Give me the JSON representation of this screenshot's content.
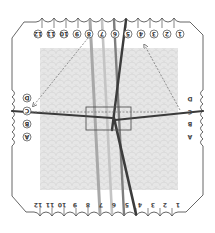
{
  "diagram": {
    "colors": {
      "outline": "#555555",
      "pattern_bg": "#e4e4e4",
      "pattern_stroke": "#d6d6d6",
      "thread_light": "#b9b9b9",
      "thread_mid": "#8c8c8c",
      "thread_dark": "#4a4a4a",
      "thread_darkest": "#333333",
      "arrow": "#777777",
      "center_box": "#555555"
    },
    "top_labels": [
      "12",
      "11",
      "10",
      "9",
      "8",
      "7",
      "6",
      "5",
      "4",
      "3",
      "2",
      "1"
    ],
    "bottom_labels": [
      "12",
      "11",
      "10",
      "9",
      "8",
      "7",
      "6",
      "5",
      "4",
      "3",
      "2",
      "1"
    ],
    "left_labels": [
      "D",
      "C",
      "B",
      "A"
    ],
    "right_labels": [
      "D",
      "C",
      "B",
      "A"
    ],
    "label_orientation": {
      "top": "rotated 180° circled",
      "bottom": "rotated 180° plain",
      "left": "rotated 180° circled",
      "right": "rotated 180° plain"
    },
    "arrows": [
      {
        "name": "arrow-slot-8-to-D-left",
        "from": "top slot 8",
        "to": "left slot D",
        "style": "dashed"
      },
      {
        "name": "arrow-right-to-slot-4",
        "from": "right slot C area",
        "to": "top slot 4",
        "style": "dashed"
      },
      {
        "name": "arrow-horizontal-C",
        "from": "left slot C",
        "to": "right slot C",
        "style": "dashed"
      }
    ]
  }
}
